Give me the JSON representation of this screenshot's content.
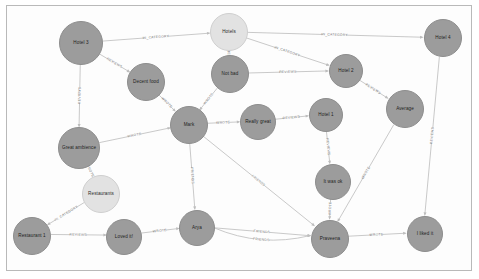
{
  "app": {
    "title": "Graph Visualization",
    "canvas_background": "#fdfdfd",
    "frame_color": "#b9b9b9"
  },
  "legend": {
    "node_color_person_review": "#9c9c9c",
    "node_color_category": "#e2e2e2",
    "edge_color": "#c3c3c3"
  },
  "chart_data": {
    "type": "graph",
    "nodes": [
      {
        "id": "hotel3",
        "label": "Hotel 3",
        "x": 80,
        "y": 42,
        "r": 22,
        "kind": "grey"
      },
      {
        "id": "hotels",
        "label": "Hotels",
        "x": 228,
        "y": 31,
        "r": 19,
        "kind": "light"
      },
      {
        "id": "hotel4",
        "label": "Hotel 4",
        "x": 442,
        "y": 37,
        "r": 19,
        "kind": "grey"
      },
      {
        "id": "decentfood",
        "label": "Decent food",
        "x": 145,
        "y": 81,
        "r": 19,
        "kind": "grey"
      },
      {
        "id": "notbad",
        "label": "Not bad",
        "x": 229,
        "y": 73,
        "r": 19,
        "kind": "grey"
      },
      {
        "id": "hotel2",
        "label": "Hotel 2",
        "x": 345,
        "y": 70,
        "r": 17,
        "kind": "grey"
      },
      {
        "id": "mark",
        "label": "Mark",
        "x": 188,
        "y": 124,
        "r": 19,
        "kind": "grey"
      },
      {
        "id": "reallygreat",
        "label": "Really great",
        "x": 257,
        "y": 121,
        "r": 18,
        "kind": "grey"
      },
      {
        "id": "hotel1",
        "label": "Hotel 1",
        "x": 325,
        "y": 114,
        "r": 17,
        "kind": "grey"
      },
      {
        "id": "average",
        "label": "Average",
        "x": 404,
        "y": 108,
        "r": 19,
        "kind": "grey"
      },
      {
        "id": "greatambience",
        "label": "Great ambience",
        "x": 78,
        "y": 147,
        "r": 21,
        "kind": "grey"
      },
      {
        "id": "itwasok",
        "label": "It was ok",
        "x": 332,
        "y": 181,
        "r": 18,
        "kind": "grey"
      },
      {
        "id": "restaurants",
        "label": "Restaurants",
        "x": 100,
        "y": 193,
        "r": 19,
        "kind": "light"
      },
      {
        "id": "restaurant1",
        "label": "Restaurant 1",
        "x": 31,
        "y": 235,
        "r": 19,
        "kind": "grey"
      },
      {
        "id": "lovedit",
        "label": "Loved it!",
        "x": 123,
        "y": 236,
        "r": 18,
        "kind": "grey"
      },
      {
        "id": "arya",
        "label": "Arya",
        "x": 196,
        "y": 227,
        "r": 18,
        "kind": "grey"
      },
      {
        "id": "praveena",
        "label": "Praveena",
        "x": 329,
        "y": 238,
        "r": 19,
        "kind": "grey"
      },
      {
        "id": "ilikedit",
        "label": "I liked it",
        "x": 424,
        "y": 233,
        "r": 18,
        "kind": "grey"
      }
    ],
    "edges": [
      {
        "source": "hotel3",
        "target": "hotels",
        "label": "IN_CATEGORY"
      },
      {
        "source": "hotel3",
        "target": "decentfood",
        "label": "REVIEWS"
      },
      {
        "source": "hotel3",
        "target": "greatambience",
        "label": "REVIEWS"
      },
      {
        "source": "hotels",
        "target": "notbad",
        "label": "IN_CATEGORY"
      },
      {
        "source": "hotels",
        "target": "hotel2",
        "label": "IN_CATEGORY"
      },
      {
        "source": "hotels",
        "target": "hotel4",
        "label": "IN_CATEGORY"
      },
      {
        "source": "notbad",
        "target": "hotel2",
        "label": "REVIEWS"
      },
      {
        "source": "notbad",
        "target": "mark",
        "label": "WROTE"
      },
      {
        "source": "decentfood",
        "target": "mark",
        "label": "WROTE"
      },
      {
        "source": "greatambience",
        "target": "mark",
        "label": "WROTE"
      },
      {
        "source": "mark",
        "target": "reallygreat",
        "label": "WROTE"
      },
      {
        "source": "reallygreat",
        "target": "hotel1",
        "label": "REVIEWS"
      },
      {
        "source": "hotel2",
        "target": "average",
        "label": "REVIEWS"
      },
      {
        "source": "hotel1",
        "target": "itwasok",
        "label": "REVIEWS"
      },
      {
        "source": "average",
        "target": "praveena",
        "label": "WROTE"
      },
      {
        "source": "hotel4",
        "target": "ilikedit",
        "label": "REVIEWS"
      },
      {
        "source": "itwasok",
        "target": "praveena",
        "label": "WROTE"
      },
      {
        "source": "mark",
        "target": "arya",
        "label": "FRIENDS"
      },
      {
        "source": "mark",
        "target": "praveena",
        "label": "FRIENDS"
      },
      {
        "source": "greatambience",
        "target": "restaurants",
        "label": "WROTE"
      },
      {
        "source": "restaurants",
        "target": "restaurant1",
        "label": "IN_CATEGORY"
      },
      {
        "source": "restaurant1",
        "target": "lovedit",
        "label": "REVIEWS"
      },
      {
        "source": "lovedit",
        "target": "arya",
        "label": "WROTE"
      },
      {
        "source": "arya",
        "target": "praveena",
        "label": "FRIENDS"
      },
      {
        "source": "arya",
        "target": "praveena",
        "label": "FRIENDS"
      },
      {
        "source": "praveena",
        "target": "ilikedit",
        "label": "WROTE"
      }
    ],
    "edge_label_vocabulary": [
      "IN_CATEGORY",
      "REVIEWS",
      "WROTE",
      "FRIENDS"
    ]
  }
}
